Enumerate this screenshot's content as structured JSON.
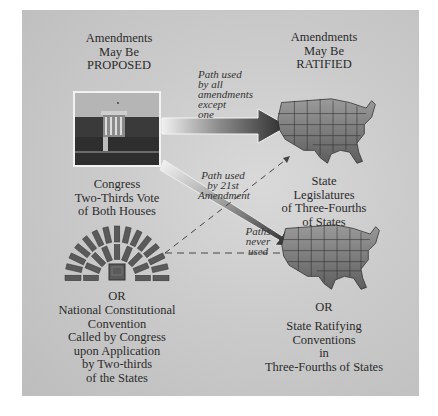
{
  "proposal": {
    "heading": [
      "Amendments",
      "May Be",
      "PROPOSED"
    ],
    "congress_method": [
      "Congress",
      "Two-Thirds Vote",
      "of Both Houses"
    ],
    "or_label": "OR",
    "convention_method": [
      "National Constitutional",
      "Convention",
      "Called by Congress",
      "upon  Application",
      "by Two-thirds",
      "of the States"
    ]
  },
  "ratification": {
    "heading": [
      "Amendments",
      "May Be",
      "RATIFIED"
    ],
    "legislatures_method": [
      "State",
      "Legislatures",
      "of Three-Fourths",
      "of States"
    ],
    "or_label": "OR",
    "conventions_method": [
      "State Ratifying",
      "Conventions",
      "in",
      "Three-Fourths of States"
    ]
  },
  "paths": {
    "all_but_one": [
      "Path used",
      "by all",
      "amendments",
      "except",
      "one"
    ],
    "twenty_first": [
      "Path used",
      "by 21st",
      "Amendment"
    ],
    "never_used": [
      "Paths",
      "never",
      "used"
    ]
  },
  "images": {
    "congress": "capitol-building-photo",
    "convention": "assembly-seating-icon",
    "map": "united-states-map"
  }
}
